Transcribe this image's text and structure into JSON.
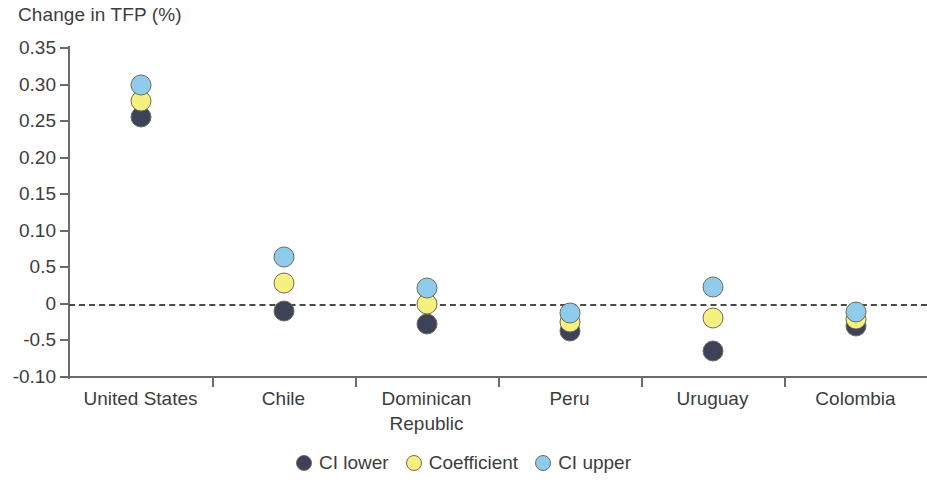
{
  "chart_data": {
    "type": "scatter",
    "title": "",
    "ylabel": "Change in TFP (%)",
    "xlabel": "",
    "ylim": [
      -0.1,
      0.35
    ],
    "grid": false,
    "legend_position": "bottom-center",
    "zero_reference_line": true,
    "categories": [
      "United States",
      "Chile",
      "Dominican\nRepublic",
      "Peru",
      "Uruguay",
      "Colombia"
    ],
    "y_tick_labels": [
      "0.35",
      "0.30",
      "0.25",
      "0.20",
      "0.15",
      "0.10",
      "0.5",
      "0",
      "-0.5",
      "-0.10"
    ],
    "y_tick_values": [
      0.35,
      0.3,
      0.25,
      0.2,
      0.15,
      0.1,
      0.05,
      0.0,
      -0.05,
      -0.1
    ],
    "series": [
      {
        "name": "CI lower",
        "color": "#3d4259",
        "values": [
          0.255,
          -0.01,
          -0.027,
          -0.037,
          -0.064,
          -0.03
        ]
      },
      {
        "name": "Coefficient",
        "color": "#f5f07f",
        "values": [
          0.278,
          0.029,
          0.0,
          -0.025,
          -0.019,
          -0.021
        ]
      },
      {
        "name": "CI upper",
        "color": "#8fccec",
        "values": [
          0.299,
          0.064,
          0.022,
          -0.012,
          0.023,
          -0.011
        ]
      }
    ],
    "colors": {
      "ci_lower": "#3d4259",
      "coefficient": "#f5f07f",
      "ci_upper": "#8fccec",
      "axis": "#6b6b6b",
      "text": "#3d3d3d",
      "marker_outline": "#6d6d55"
    }
  }
}
